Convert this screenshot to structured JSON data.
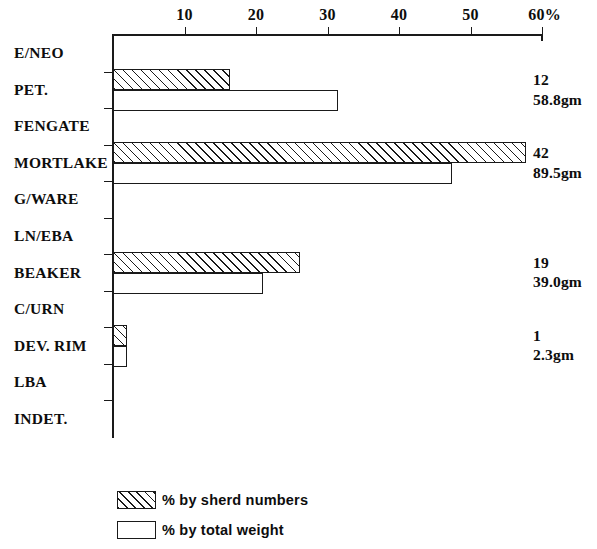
{
  "chart_data": {
    "type": "bar",
    "orientation": "horizontal",
    "title": "",
    "xlabel": "",
    "ylabel": "",
    "xlim": [
      0,
      60
    ],
    "xticks": [
      10,
      20,
      30,
      40,
      50,
      60
    ],
    "xtick_labels": [
      "10",
      "20",
      "30",
      "40",
      "50",
      "60%"
    ],
    "grid": false,
    "legend_position": "bottom-left",
    "categories": [
      "E/NEO",
      "PET.",
      "FENGATE",
      "MORTLAKE",
      "G/WARE",
      "LN/EBA",
      "BEAKER",
      "C/URN",
      "DEV. RIM",
      "LBA",
      "INDET."
    ],
    "series": [
      {
        "name": "% by sherd numbers",
        "style": "hatched",
        "values": [
          0,
          16.4,
          0,
          57.8,
          0,
          0,
          26.2,
          0,
          2.0,
          0,
          0
        ]
      },
      {
        "name": "% by total weight",
        "style": "white",
        "values": [
          0,
          31.5,
          0,
          47.4,
          0,
          0,
          21.0,
          0,
          2.0,
          0,
          0
        ]
      }
    ],
    "annotations": [
      {
        "category": "PET.",
        "count": "12",
        "weight": "58.8gm"
      },
      {
        "category": "MORTLAKE",
        "count": "42",
        "weight": "89.5gm"
      },
      {
        "category": "BEAKER",
        "count": "19",
        "weight": "39.0gm"
      },
      {
        "category": "DEV. RIM",
        "count": "1",
        "weight": "2.3gm"
      }
    ]
  },
  "axis": {
    "ticks": [
      {
        "label": "10",
        "value": 10
      },
      {
        "label": "20",
        "value": 20
      },
      {
        "label": "30",
        "value": 30
      },
      {
        "label": "40",
        "value": 40
      },
      {
        "label": "50",
        "value": 50
      },
      {
        "label": "60%",
        "value": 60
      }
    ]
  },
  "categories": [
    {
      "label": "E/NEO"
    },
    {
      "label": "PET."
    },
    {
      "label": "FENGATE"
    },
    {
      "label": "MORTLAKE"
    },
    {
      "label": "G/WARE"
    },
    {
      "label": "LN/EBA"
    },
    {
      "label": "BEAKER"
    },
    {
      "label": "C/URN"
    },
    {
      "label": "DEV. RIM"
    },
    {
      "label": "LBA"
    },
    {
      "label": "INDET."
    }
  ],
  "legend": {
    "items": [
      {
        "label": "% by sherd numbers",
        "style": "hatched"
      },
      {
        "label": "% by total weight",
        "style": "white"
      }
    ]
  },
  "annotations": [
    {
      "count": "12",
      "weight": "58.8gm"
    },
    {
      "count": "42",
      "weight": "89.5gm"
    },
    {
      "count": "19",
      "weight": "39.0gm"
    },
    {
      "count": "1",
      "weight": "2.3gm"
    }
  ],
  "colors": {
    "ink": "#1a1a1a",
    "background": "#ffffff"
  }
}
